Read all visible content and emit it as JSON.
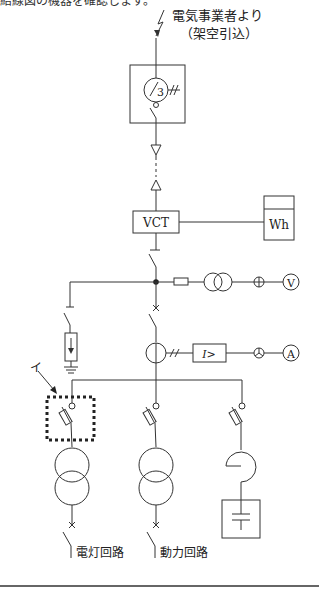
{
  "header": {
    "cut_off_text": "結線図の機器を確認します。"
  },
  "labels": {
    "source_line1": "電気事業者より",
    "source_line2": "（架空引込）",
    "pas_count": "3",
    "vct": "VCT",
    "wh": "Wh",
    "relay": "I>",
    "voltmeter": "V",
    "ammeter": "A",
    "pointer_mark": "イ",
    "circuit_lighting": "電灯回路",
    "circuit_power": "動力回路"
  },
  "colors": {
    "line": "#333333",
    "background": "#ffffff",
    "rule": "#666666"
  }
}
